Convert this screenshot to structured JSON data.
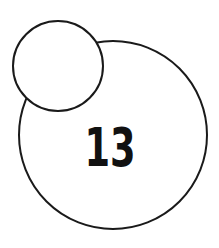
{
  "diagram": {
    "large_circle": {
      "label": "13",
      "cx": 113,
      "cy": 135,
      "r": 94
    },
    "small_circle": {
      "label": "",
      "cx": 58,
      "cy": 66,
      "r": 45
    },
    "stroke_color": "#1a1a1a",
    "fill_color": "#ffffff"
  }
}
